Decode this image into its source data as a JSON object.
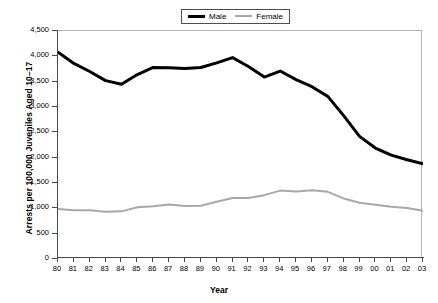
{
  "chart_data": {
    "type": "line",
    "title": "",
    "xlabel": "Year",
    "ylabel": "Arrests per 100,000 Juveniles Aged 10–17",
    "xlim": [
      1980,
      2003
    ],
    "ylim": [
      0,
      4500
    ],
    "ytick_labels": [
      "4,500",
      "4,000",
      "3,500",
      "3,000",
      "2,500",
      "2,000",
      "1,500",
      "1,000",
      "500",
      "0"
    ],
    "ytick_values": [
      4500,
      4000,
      3500,
      3000,
      2500,
      2000,
      1500,
      1000,
      500,
      0
    ],
    "categories": [
      "80",
      "81",
      "82",
      "83",
      "84",
      "85",
      "86",
      "87",
      "88",
      "89",
      "90",
      "91",
      "92",
      "93",
      "94",
      "95",
      "96",
      "97",
      "98",
      "99",
      "00",
      "01",
      "02",
      "03"
    ],
    "grid": false,
    "legend_position": "top-center",
    "series": [
      {
        "name": "Male",
        "color": "#000000",
        "width": 3,
        "values": [
          4080,
          3860,
          3700,
          3520,
          3450,
          3640,
          3780,
          3775,
          3760,
          3780,
          3870,
          3975,
          3800,
          3590,
          3710,
          3540,
          3400,
          3210,
          2830,
          2420,
          2190,
          2050,
          1960,
          1880
        ]
      },
      {
        "name": "Female",
        "color": "#a8a8a8",
        "width": 2,
        "values": [
          985,
          960,
          960,
          935,
          940,
          1020,
          1040,
          1075,
          1045,
          1050,
          1130,
          1205,
          1205,
          1260,
          1350,
          1330,
          1355,
          1325,
          1195,
          1110,
          1070,
          1030,
          1005,
          950
        ]
      }
    ]
  },
  "legend": {
    "items": [
      {
        "label": "Male"
      },
      {
        "label": "Female"
      }
    ]
  },
  "axes": {
    "x_title": "Year",
    "y_title": "Arrests per 100,000 Juveniles Aged 10–17"
  }
}
